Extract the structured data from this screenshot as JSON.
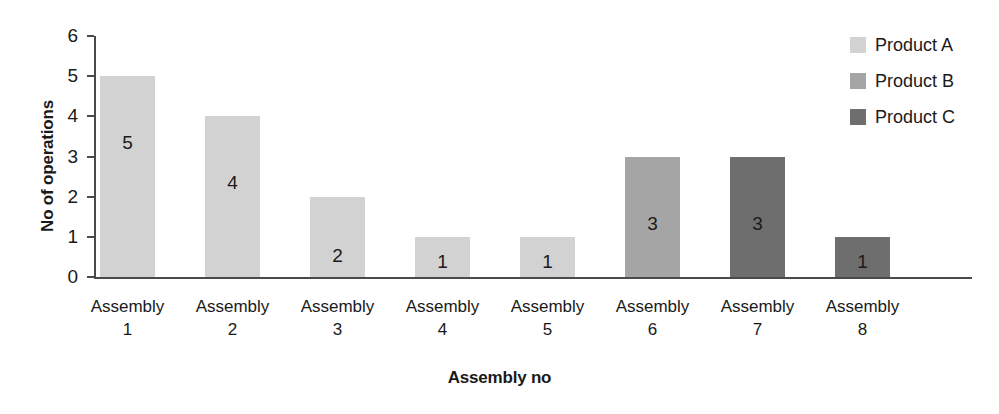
{
  "chart_data": {
    "type": "bar",
    "title": "",
    "xlabel": "Assembly no",
    "ylabel": "No of operations",
    "categories": [
      "Assembly 1",
      "Assembly 2",
      "Assembly 3",
      "Assembly 4",
      "Assembly 5",
      "Assembly 6",
      "Assembly 7",
      "Assembly 8"
    ],
    "category_lines": [
      {
        "name": "Assembly",
        "num": "1"
      },
      {
        "name": "Assembly",
        "num": "2"
      },
      {
        "name": "Assembly",
        "num": "3"
      },
      {
        "name": "Assembly",
        "num": "4"
      },
      {
        "name": "Assembly",
        "num": "5"
      },
      {
        "name": "Assembly",
        "num": "6"
      },
      {
        "name": "Assembly",
        "num": "7"
      },
      {
        "name": "Assembly",
        "num": "8"
      }
    ],
    "values": [
      5,
      4,
      2,
      1,
      1,
      3,
      3,
      1
    ],
    "point_series": [
      "Product A",
      "Product A",
      "Product A",
      "Product A",
      "Product A",
      "Product B",
      "Product C",
      "Product C"
    ],
    "data_labels": [
      "5",
      "4",
      "2",
      "1",
      "1",
      "3",
      "3",
      "1"
    ],
    "ylim": [
      0,
      6
    ],
    "ytick_labels": [
      "6",
      "5",
      "4",
      "3",
      "2",
      "1",
      "0"
    ],
    "ytick_values": [
      6,
      5,
      4,
      3,
      2,
      1,
      0
    ],
    "grid": false,
    "legend_position": "top-right",
    "series": [
      {
        "name": "Product A",
        "color": "#d2d2d2",
        "values": [
          5,
          4,
          2,
          1,
          1,
          null,
          null,
          null
        ]
      },
      {
        "name": "Product B",
        "color": "#a5a5a5",
        "values": [
          null,
          null,
          null,
          null,
          null,
          3,
          null,
          null
        ]
      },
      {
        "name": "Product C",
        "color": "#6e6e6e",
        "values": [
          null,
          null,
          null,
          null,
          null,
          null,
          3,
          1
        ]
      }
    ]
  },
  "legend": {
    "items": [
      {
        "label": "Product A",
        "color": "#d2d2d2"
      },
      {
        "label": "Product B",
        "color": "#a5a5a5"
      },
      {
        "label": "Product C",
        "color": "#6e6e6e"
      }
    ]
  },
  "colors": {
    "axis": "#4a4a4a",
    "text": "#1a1a1a",
    "background": "#ffffff",
    "product_a": "#d2d2d2",
    "product_b": "#a5a5a5",
    "product_c": "#6e6e6e"
  }
}
